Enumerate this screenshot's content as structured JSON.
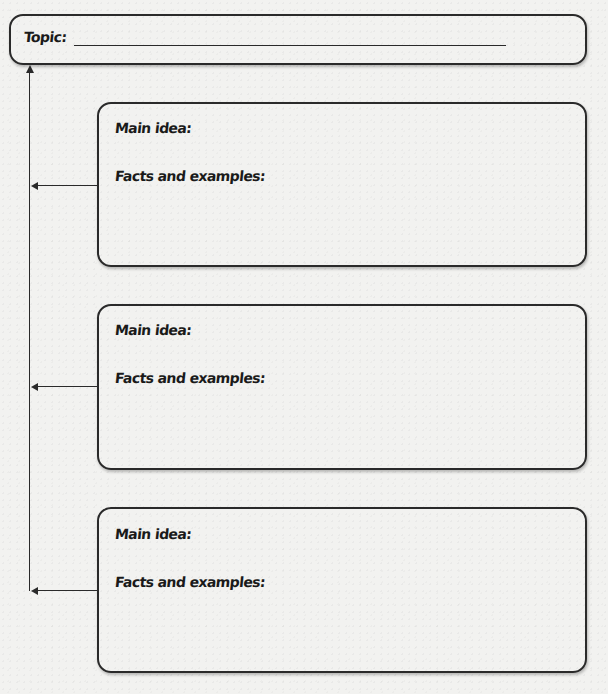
{
  "organizer": {
    "topic": {
      "label": "Topic:",
      "value": ""
    },
    "ideas": [
      {
        "main_idea_label": "Main idea:",
        "main_idea_value": "",
        "facts_label": "Facts and examples:",
        "facts_value": ""
      },
      {
        "main_idea_label": "Main idea:",
        "main_idea_value": "",
        "facts_label": "Facts and examples:",
        "facts_value": ""
      },
      {
        "main_idea_label": "Main idea:",
        "main_idea_value": "",
        "facts_label": "Facts and examples:",
        "facts_value": ""
      }
    ]
  },
  "colors": {
    "paper": "#f2f2f0",
    "ink": "#1a1a1a",
    "line": "#2a2a2a"
  }
}
